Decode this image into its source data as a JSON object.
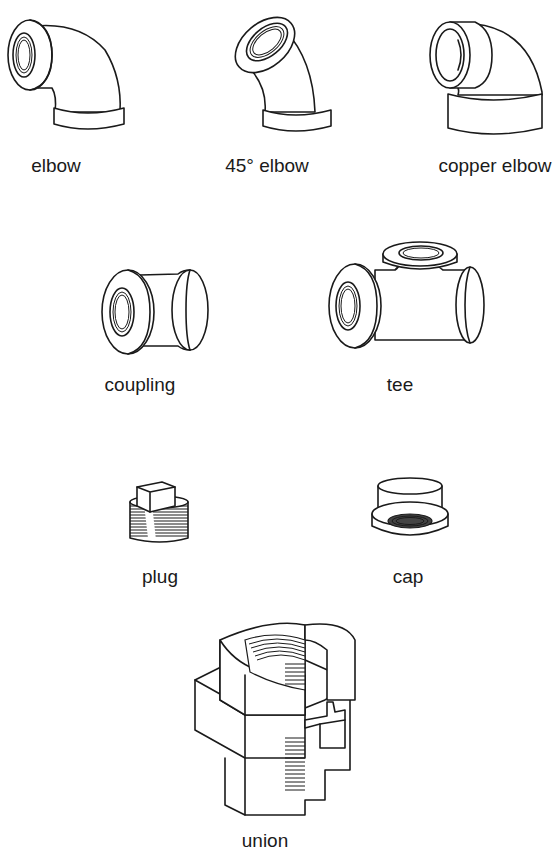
{
  "diagram": {
    "type": "pipe-fittings-illustration",
    "fittings": [
      {
        "id": "elbow",
        "label": "elbow"
      },
      {
        "id": "elbow-45",
        "label": "45° elbow"
      },
      {
        "id": "copper-elbow",
        "label": "copper elbow"
      },
      {
        "id": "coupling",
        "label": "coupling"
      },
      {
        "id": "tee",
        "label": "tee"
      },
      {
        "id": "plug",
        "label": "plug"
      },
      {
        "id": "cap",
        "label": "cap"
      },
      {
        "id": "union",
        "label": "union"
      }
    ]
  }
}
